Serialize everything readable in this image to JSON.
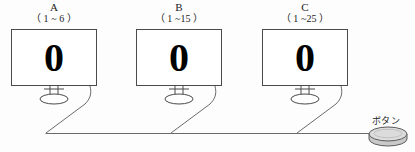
{
  "diagram": {
    "title_alt": "three-monitor-button-setup",
    "monitors": [
      {
        "name": "A",
        "range": "（ 1 ~ 6 ）",
        "display_value": "0",
        "x": 11,
        "y": 29,
        "w": 86,
        "h": 57
      },
      {
        "name": "B",
        "range": "（ 1 ~15 ）",
        "display_value": "0",
        "x": 136,
        "y": 29,
        "w": 86,
        "h": 57
      },
      {
        "name": "C",
        "range": "（ 1 ~25 ）",
        "display_value": "0",
        "x": 262,
        "y": 29,
        "w": 86,
        "h": 57
      }
    ],
    "button": {
      "label": "ボタン",
      "cx": 388,
      "cy": 135,
      "rx": 19,
      "ry": 7
    },
    "bus_line": {
      "y": 134,
      "x_start": 45,
      "x_end": 369
    },
    "colors": {
      "outline": "#4a4a4a",
      "screen_fill": "#ffffff",
      "digit": "#000000",
      "cable": "#6b6b6b",
      "button_fill": "#d8d8d8",
      "button_edge": "#5a5a5a",
      "background": "#fdfdfd",
      "text": "#1c1c1c"
    }
  }
}
